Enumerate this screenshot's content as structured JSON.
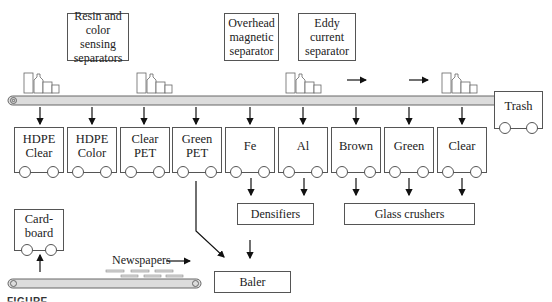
{
  "diagram": {
    "title_boxes": {
      "resin": "Resin and color sensing separators",
      "resin_lines": [
        "Resin and",
        "color sensing",
        "separators"
      ],
      "magnetic_lines": [
        "Overhead",
        "magnetic",
        "separator"
      ],
      "eddy_lines": [
        "Eddy",
        "current",
        "separator"
      ]
    },
    "bins": [
      {
        "id": "hdpe-clear",
        "lines": [
          "HDPE",
          "Clear"
        ]
      },
      {
        "id": "hdpe-color",
        "lines": [
          "HDPE",
          "Color"
        ]
      },
      {
        "id": "clear-pet",
        "lines": [
          "Clear",
          "PET"
        ]
      },
      {
        "id": "green-pet",
        "lines": [
          "Green",
          "PET"
        ]
      },
      {
        "id": "fe",
        "lines": [
          "Fe"
        ]
      },
      {
        "id": "al",
        "lines": [
          "Al"
        ]
      },
      {
        "id": "brown",
        "lines": [
          "Brown"
        ]
      },
      {
        "id": "green",
        "lines": [
          "Green"
        ]
      },
      {
        "id": "clear",
        "lines": [
          "Clear"
        ]
      }
    ],
    "trash": "Trash",
    "cardboard_lines": [
      "Card-",
      "board"
    ],
    "processors": {
      "densifiers": "Densifiers",
      "glass_crushers": "Glass crushers",
      "baler": "Baler"
    },
    "newspapers_label": "Newspapers",
    "caption": "FIGURE"
  },
  "colors": {
    "line": "#555555",
    "conveyor_fill": "#dcdcdc",
    "arrow": "#111111"
  }
}
